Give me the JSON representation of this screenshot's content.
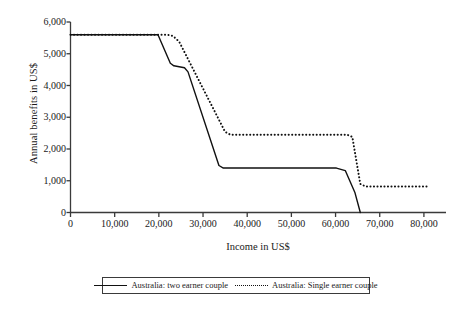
{
  "chart_data": {
    "type": "line",
    "title": "",
    "xlabel": "Income in US$",
    "ylabel": "Annual benefits in US$",
    "xlim": [
      0,
      85000
    ],
    "ylim": [
      0,
      6000
    ],
    "xticks": [
      0,
      10000,
      20000,
      30000,
      40000,
      50000,
      60000,
      70000,
      80000
    ],
    "xtick_labels": [
      "0",
      "10,000",
      "20,000",
      "30,000",
      "40,000",
      "50,000",
      "60,000",
      "70,000",
      "80,000"
    ],
    "yticks": [
      0,
      1000,
      2000,
      3000,
      4000,
      5000,
      6000
    ],
    "ytick_labels": [
      "0",
      "1,000",
      "2,000",
      "3,000",
      "4,000",
      "5,000",
      "6,000"
    ],
    "grid": false,
    "legend_position": "bottom",
    "series": [
      {
        "name": "Australia: two earner couple",
        "style": "solid",
        "color": "#111111",
        "points": [
          [
            0,
            5600
          ],
          [
            19800,
            5600
          ],
          [
            22600,
            4700
          ],
          [
            23400,
            4620
          ],
          [
            25800,
            4560
          ],
          [
            26600,
            4430
          ],
          [
            33600,
            1480
          ],
          [
            34600,
            1400
          ],
          [
            60200,
            1400
          ],
          [
            62200,
            1320
          ],
          [
            64400,
            620
          ],
          [
            65600,
            0
          ]
        ]
      },
      {
        "name": "Australia: Single earner couple",
        "style": "dotted",
        "color": "#111111",
        "points": [
          [
            0,
            5600
          ],
          [
            21800,
            5600
          ],
          [
            23200,
            5560
          ],
          [
            24600,
            5380
          ],
          [
            35000,
            2540
          ],
          [
            36200,
            2450
          ],
          [
            62600,
            2450
          ],
          [
            63800,
            2380
          ],
          [
            65600,
            900
          ],
          [
            66800,
            820
          ],
          [
            81000,
            820
          ]
        ]
      }
    ]
  },
  "legend": {
    "entries": [
      {
        "label": "Australia: two earner couple",
        "style": "solid"
      },
      {
        "label": "Australia: Single earner couple",
        "style": "dotted"
      }
    ]
  }
}
